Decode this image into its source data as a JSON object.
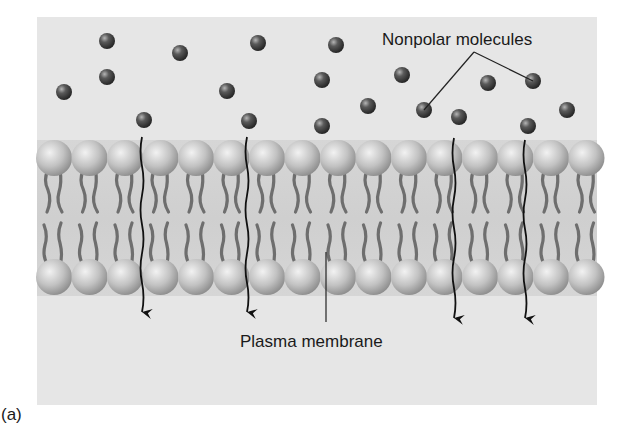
{
  "figure": {
    "panel_label": "(a)",
    "labels": {
      "nonpolar_molecules": "Nonpolar molecules",
      "plasma_membrane": "Plasma membrane"
    },
    "colors": {
      "panel_background": "#e6e6e6",
      "membrane_band": "#d2d2d2",
      "head_fill": "#c4c4c4",
      "tail_stroke": "#6e6e6e",
      "molecule_fill": "#3a3a3a",
      "arrow_stroke": "#111111",
      "leader_line": "#222222"
    },
    "panel": {
      "x": 37,
      "y": 17,
      "width": 560,
      "height": 388
    },
    "membrane": {
      "top_head_row_y": 158,
      "bottom_head_row_y": 277,
      "head_radius": 18,
      "head_count": 16,
      "first_head_x": 54,
      "head_spacing": 35.5
    },
    "molecules": [
      {
        "x": 107,
        "y": 41
      },
      {
        "x": 180,
        "y": 53
      },
      {
        "x": 258,
        "y": 43
      },
      {
        "x": 336,
        "y": 45
      },
      {
        "x": 107,
        "y": 77
      },
      {
        "x": 64,
        "y": 92
      },
      {
        "x": 227,
        "y": 91
      },
      {
        "x": 322,
        "y": 80
      },
      {
        "x": 402,
        "y": 75
      },
      {
        "x": 488,
        "y": 83
      },
      {
        "x": 533,
        "y": 81
      },
      {
        "x": 368,
        "y": 106
      },
      {
        "x": 424,
        "y": 110
      },
      {
        "x": 459,
        "y": 117
      },
      {
        "x": 567,
        "y": 110
      },
      {
        "x": 322,
        "y": 126
      },
      {
        "x": 144,
        "y": 120
      },
      {
        "x": 249,
        "y": 121
      },
      {
        "x": 528,
        "y": 126
      }
    ],
    "crossing_arrows": [
      {
        "x": 142,
        "y_start": 137,
        "y_end": 312
      },
      {
        "x": 247,
        "y_start": 137,
        "y_end": 312
      },
      {
        "x": 454,
        "y_start": 138,
        "y_end": 318
      },
      {
        "x": 525,
        "y_start": 140,
        "y_end": 318
      }
    ],
    "leaders": {
      "nonpolar": {
        "apex": [
          474,
          52
        ],
        "targets": [
          [
            424,
            110
          ],
          [
            533,
            81
          ]
        ]
      },
      "membrane": {
        "from": [
          326,
          252
        ],
        "to": [
          326,
          322
        ]
      }
    }
  }
}
